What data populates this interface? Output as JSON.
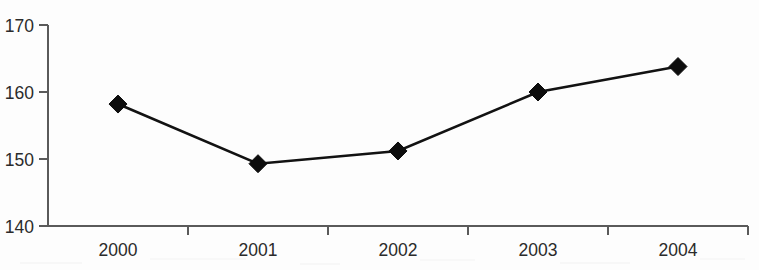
{
  "chart_data": {
    "type": "line",
    "title": "",
    "subtitle": "",
    "xlabel": "",
    "ylabel": "",
    "categories": [
      "2000",
      "2001",
      "2002",
      "2003",
      "2004"
    ],
    "values": [
      158.2,
      149.3,
      151.2,
      160.0,
      163.8
    ],
    "series": [
      {
        "name": "",
        "values": [
          158.2,
          149.3,
          151.2,
          160.0,
          163.8
        ]
      }
    ],
    "ylim": [
      140,
      170
    ],
    "y_ticks": [
      140,
      150,
      160,
      170
    ],
    "y_tick_labels": [
      "140",
      "150",
      "160",
      "170"
    ],
    "x_tick_labels": [
      "2000",
      "2001",
      "2002",
      "2003",
      "2004"
    ],
    "grid": false,
    "legend": false,
    "legend_position": "none",
    "marker": "diamond",
    "line_color": "#121212",
    "marker_color": "#0d0d0d",
    "axis_color": "#5a5a5a",
    "background_color": "#fdfdfd",
    "annotations": []
  }
}
